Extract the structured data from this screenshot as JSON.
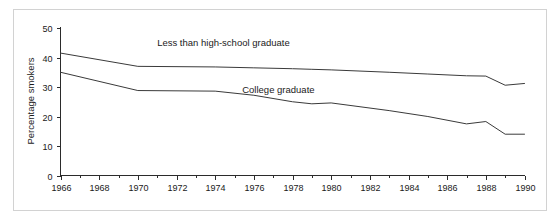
{
  "chart_data": {
    "type": "line",
    "title": "",
    "xlabel": "",
    "ylabel": "Percentage smokers",
    "xlim": [
      1966,
      1990
    ],
    "ylim": [
      0,
      50
    ],
    "grid": false,
    "legend_position": "inline-labels",
    "x_ticks": [
      1966,
      1968,
      1970,
      1972,
      1974,
      1976,
      1978,
      1980,
      1982,
      1984,
      1986,
      1988,
      1990
    ],
    "x_tick_labels": [
      "1966",
      "1968",
      "1970",
      "1972",
      "1974",
      "1976",
      "1978",
      "1980",
      "1982",
      "1984",
      "1986",
      "1988",
      "1990"
    ],
    "x_minor_ticks": [
      1967,
      1969,
      1971,
      1973,
      1975,
      1977,
      1979,
      1981,
      1983,
      1985,
      1987,
      1989
    ],
    "y_ticks": [
      0,
      10,
      20,
      30,
      40,
      50
    ],
    "y_tick_labels": [
      "0",
      "10",
      "20",
      "30",
      "40",
      "50"
    ],
    "x": [
      1966,
      1970,
      1974,
      1976,
      1978,
      1979,
      1980,
      1983,
      1985,
      1987,
      1988,
      1989,
      1990
    ],
    "series": [
      {
        "name": "Less than high-school graduate",
        "label": "Less than high-school graduate",
        "color": "#3a3a3a",
        "label_x": 1971.0,
        "label_y": 44.0,
        "values": [
          41.5,
          37.0,
          36.8,
          36.5,
          36.2,
          36.0,
          35.8,
          35.0,
          34.4,
          33.8,
          33.7,
          30.6,
          31.2
        ]
      },
      {
        "name": "College graduate",
        "label": "College graduate",
        "color": "#3a3a3a",
        "label_x": 1975.4,
        "label_y": 28.0,
        "values": [
          35.0,
          28.8,
          28.6,
          27.2,
          25.0,
          24.3,
          24.6,
          22.0,
          20.0,
          17.5,
          18.3,
          14.0,
          14.0
        ]
      }
    ]
  },
  "axis": {
    "y_title": "Percentage smokers"
  }
}
